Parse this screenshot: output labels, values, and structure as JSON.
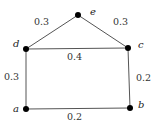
{
  "graph": {
    "nodes": [
      {
        "id": "a",
        "label": "a",
        "x": 26,
        "y": 109,
        "lx": 13,
        "ly": 112
      },
      {
        "id": "b",
        "label": "b",
        "x": 130,
        "y": 108,
        "lx": 138,
        "ly": 108
      },
      {
        "id": "c",
        "label": "c",
        "x": 128,
        "y": 48,
        "lx": 138,
        "ly": 48
      },
      {
        "id": "d",
        "label": "d",
        "x": 26,
        "y": 49,
        "lx": 13,
        "ly": 47
      },
      {
        "id": "e",
        "label": "e",
        "x": 78,
        "y": 15,
        "lx": 90,
        "ly": 15
      }
    ],
    "edges": [
      {
        "from": "d",
        "to": "e",
        "weight": "0.3",
        "lx": 34,
        "ly": 25
      },
      {
        "from": "e",
        "to": "c",
        "weight": "0.3",
        "lx": 113,
        "ly": 25
      },
      {
        "from": "d",
        "to": "c",
        "weight": "0.4",
        "lx": 67,
        "ly": 60
      },
      {
        "from": "d",
        "to": "a",
        "weight": "0.3",
        "lx": 4,
        "ly": 80
      },
      {
        "from": "c",
        "to": "b",
        "weight": "0.2",
        "lx": 136,
        "ly": 81
      },
      {
        "from": "a",
        "to": "b",
        "weight": "0.2",
        "lx": 67,
        "ly": 120
      }
    ]
  }
}
